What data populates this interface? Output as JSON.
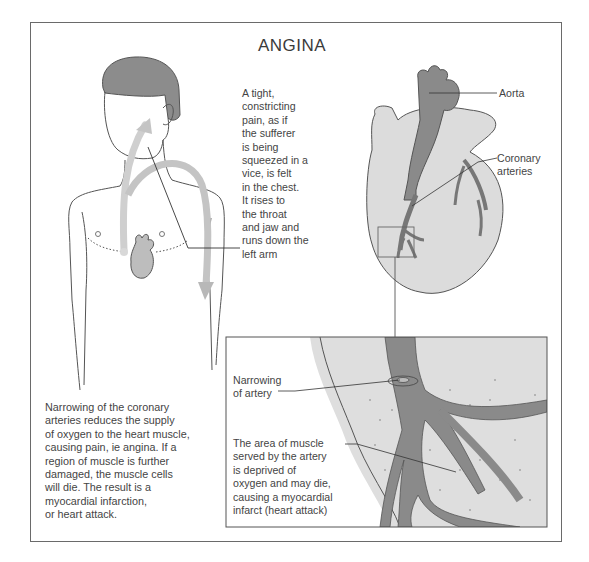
{
  "figure": {
    "title": "ANGINA",
    "pain_description": "A tight,\nconstricting\npain, as if\nthe sufferer\nis being\nsqueezed in a\nvice, is felt\nin the chest.\nIt rises to\nthe throat\nand jaw and\nruns down the\nleft arm",
    "heart_labels": {
      "aorta": "Aorta",
      "coronary_arteries": "Coronary\narteries"
    },
    "inset_labels": {
      "narrowing": "Narrowing\nof artery",
      "deprived_area": "The area of muscle\nserved by the artery\nis deprived of\noxygen and may die,\ncausing a myocardial\ninfarct (heart attack)"
    },
    "caption": "Narrowing of the coronary\narteries reduces the supply\nof oxygen to the heart muscle,\ncausing pain, ie angina. If a\nregion of muscle is further\ndamaged, the muscle cells\nwill die. The result is a\nmyocardial infarction,\nor heart attack.",
    "colors": {
      "hair": "#8c8c8c",
      "heart_fill": "#dcdcdc",
      "artery_fill": "#8a8a8a",
      "pain_arrow": "#c4c4c4",
      "outline": "#555555"
    }
  }
}
